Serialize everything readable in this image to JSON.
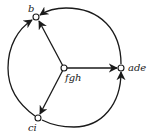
{
  "diagram": {
    "type": "directed-graph",
    "nodes": [
      {
        "id": "b",
        "label": "b",
        "x": 36,
        "y": 17
      },
      {
        "id": "fgh",
        "label": "fgh",
        "x": 64,
        "y": 68
      },
      {
        "id": "ade",
        "label": "ade",
        "x": 121,
        "y": 68
      },
      {
        "id": "ci",
        "label": "ci",
        "x": 38,
        "y": 118
      }
    ],
    "edges": [
      {
        "from": "fgh",
        "to": "b",
        "style": "straight"
      },
      {
        "from": "fgh",
        "to": "ade",
        "style": "straight"
      },
      {
        "from": "fgh",
        "to": "ci",
        "style": "straight"
      },
      {
        "from": "ade",
        "to": "b",
        "style": "arc"
      },
      {
        "from": "ci",
        "to": "b",
        "style": "arc"
      },
      {
        "from": "ci",
        "to": "ade",
        "style": "arc"
      }
    ],
    "labels": {
      "b": "b",
      "fgh": "fgh",
      "ade": "ade",
      "ci": "ci"
    }
  }
}
